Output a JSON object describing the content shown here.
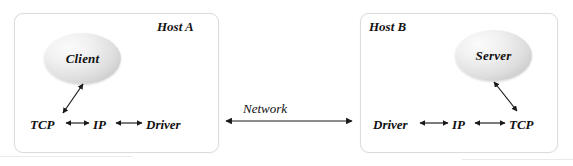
{
  "diagram": {
    "type": "network-client-server-stack",
    "background_color": "#ffffff",
    "hosts": [
      {
        "id": "host-a",
        "label": "Host A",
        "node": {
          "label": "Client",
          "shape": "ellipse"
        },
        "stack": [
          "TCP",
          "IP",
          "Driver"
        ]
      },
      {
        "id": "host-b",
        "label": "Host B",
        "node": {
          "label": "Server",
          "shape": "ellipse"
        },
        "stack": [
          "Driver",
          "IP",
          "TCP"
        ]
      }
    ],
    "network": {
      "label": "Network",
      "arrow": "bidirectional"
    },
    "colors": {
      "box_border": "#dcdcdc",
      "box_fill": "#ffffff",
      "ellipse_fill": "#e2e2e2",
      "text": "#111111",
      "arrow": "#1a1a1a"
    },
    "arrows": [
      {
        "name": "client-to-tcp",
        "from": "Client",
        "to": "TCP",
        "style": "bidirectional"
      },
      {
        "name": "tcp-to-ip-a",
        "from": "TCP",
        "to": "IP",
        "style": "bidirectional"
      },
      {
        "name": "ip-to-driver-a",
        "from": "IP",
        "to": "Driver",
        "style": "bidirectional"
      },
      {
        "name": "network-link",
        "from": "Host A",
        "to": "Host B",
        "style": "bidirectional"
      },
      {
        "name": "driver-to-ip-b",
        "from": "Driver",
        "to": "IP",
        "style": "bidirectional"
      },
      {
        "name": "ip-to-tcp-b",
        "from": "IP",
        "to": "TCP",
        "style": "bidirectional"
      },
      {
        "name": "server-to-tcp",
        "from": "Server",
        "to": "TCP",
        "style": "bidirectional"
      }
    ]
  }
}
